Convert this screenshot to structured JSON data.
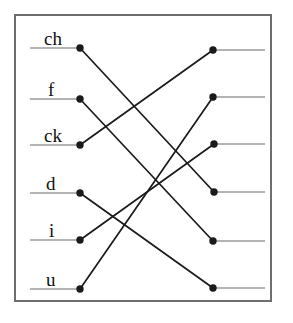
{
  "figure": {
    "type": "bipartite-matching-diagram",
    "title": "",
    "background_color": "#ffffff",
    "border_color": "#6e6e6e",
    "node_color": "#1a1a1a",
    "edge_color": "#1a1a1a",
    "stub_color": "#9a9a9a"
  },
  "left_nodes": [
    {
      "id": "L1",
      "label": "ch",
      "x": 80,
      "y": 48,
      "stub_x": 30,
      "label_x": 44,
      "label_y": 29
    },
    {
      "id": "L2",
      "label": "f",
      "x": 80,
      "y": 99,
      "stub_x": 30,
      "label_x": 48,
      "label_y": 80
    },
    {
      "id": "L3",
      "label": "ck",
      "x": 80,
      "y": 145,
      "stub_x": 30,
      "label_x": 44,
      "label_y": 126
    },
    {
      "id": "L4",
      "label": "d",
      "x": 80,
      "y": 193,
      "stub_x": 30,
      "label_x": 46,
      "label_y": 174
    },
    {
      "id": "L5",
      "label": "i",
      "x": 80,
      "y": 240,
      "stub_x": 30,
      "label_x": 49,
      "label_y": 221
    },
    {
      "id": "L6",
      "label": "u",
      "x": 80,
      "y": 289,
      "stub_x": 30,
      "label_x": 46,
      "label_y": 270
    }
  ],
  "right_nodes": [
    {
      "id": "R1",
      "label": "",
      "x": 213,
      "y": 50,
      "stub_x": 265
    },
    {
      "id": "R2",
      "label": "",
      "x": 213,
      "y": 97,
      "stub_x": 265
    },
    {
      "id": "R3",
      "label": "",
      "x": 214,
      "y": 144,
      "stub_x": 265
    },
    {
      "id": "R4",
      "label": "",
      "x": 214,
      "y": 192,
      "stub_x": 265
    },
    {
      "id": "R5",
      "label": "",
      "x": 213,
      "y": 241,
      "stub_x": 265
    },
    {
      "id": "R6",
      "label": "",
      "x": 213,
      "y": 288,
      "stub_x": 265
    }
  ],
  "edges": [
    {
      "from": "L1",
      "to": "R4",
      "from_label": "ch"
    },
    {
      "from": "L2",
      "to": "R5",
      "from_label": "f"
    },
    {
      "from": "L3",
      "to": "R1",
      "from_label": "ck"
    },
    {
      "from": "L4",
      "to": "R6",
      "from_label": "d"
    },
    {
      "from": "L5",
      "to": "R3",
      "from_label": "i"
    },
    {
      "from": "L6",
      "to": "R2",
      "from_label": "u"
    }
  ],
  "chart_data": {
    "type": "diagram",
    "categories": [
      "ch",
      "f",
      "ck",
      "d",
      "i",
      "u"
    ],
    "matching": [
      {
        "left": "ch",
        "right_index": 4
      },
      {
        "left": "f",
        "right_index": 5
      },
      {
        "left": "ck",
        "right_index": 1
      },
      {
        "left": "d",
        "right_index": 6
      },
      {
        "left": "i",
        "right_index": 3
      },
      {
        "left": "u",
        "right_index": 2
      }
    ]
  }
}
